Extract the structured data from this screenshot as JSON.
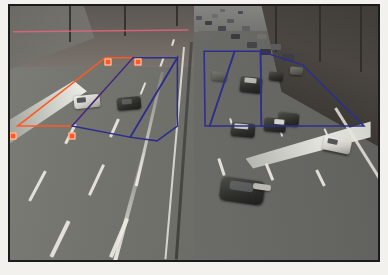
{
  "scene": {
    "title": "Highway traffic surveillance frame with annotated detection zones",
    "view": "elevated overpass camera looking down a divided multi-lane freeway",
    "left_carriageway": "near-empty lanes flowing away from camera",
    "right_carriageway": "congested queued lanes flowing toward camera",
    "frame_border_color": "#1b1b1b",
    "page_background": "#ffffff"
  },
  "annotations": {
    "colors": {
      "primary_roi": "#ff5a23",
      "secondary_roi": "#2e2e8c",
      "horizon_line": "#e8647f",
      "handle_fill": "#ff5a23",
      "handle_border": "#ffd9c8"
    },
    "regions": [
      {
        "id": "roi-red-left",
        "label": "Left carriageway detection zone",
        "color": "#ff5a23",
        "shape": "polygon",
        "points": "108,62 138,62 72,136 13,136"
      },
      {
        "id": "roi-blue-left-a",
        "label": "Left lane zone A",
        "color": "#2e2e8c",
        "shape": "polygon",
        "points": "138,62 186,62 135,148 72,136"
      },
      {
        "id": "roi-blue-left-b",
        "label": "Left lane zone B",
        "color": "#2e2e8c",
        "shape": "polygon",
        "points": "186,62 186,136 164,152 135,148"
      },
      {
        "id": "roi-blue-right-a",
        "label": "Right lane zone A",
        "color": "#2e2e8c",
        "shape": "polygon",
        "points": "215,55 248,55 221,136 216,136"
      },
      {
        "id": "roi-blue-right-b",
        "label": "Right lane zone B",
        "color": "#2e2e8c",
        "shape": "polygon",
        "points": "248,55 276,55 277,136 221,136"
      },
      {
        "id": "roi-blue-right-c",
        "label": "Right lane zone C",
        "color": "#2e2e8c",
        "shape": "polygon",
        "points": "276,55 322,70 388,136 277,136"
      }
    ],
    "horizon": {
      "id": "horizon-line",
      "label": "Calibration horizon line",
      "color": "#e8647f",
      "x1": 8,
      "y1": 34,
      "x2": 198,
      "y2": 32
    },
    "handles": [
      {
        "id": "handle-top-left",
        "label": "ROI vertex top-left",
        "x": 108,
        "y": 62
      },
      {
        "id": "handle-top-right",
        "label": "ROI vertex top-right",
        "x": 138,
        "y": 62
      },
      {
        "id": "handle-bot-left",
        "label": "ROI vertex bottom-left",
        "x": 13,
        "y": 136
      },
      {
        "id": "handle-bot-mid",
        "label": "ROI vertex bottom-mid",
        "x": 72,
        "y": 136
      }
    ]
  }
}
